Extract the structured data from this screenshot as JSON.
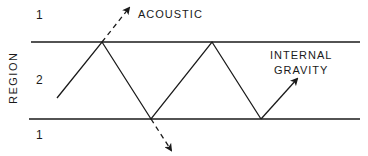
{
  "diagram": {
    "axis_title": "REGION",
    "regions": {
      "upper": "1",
      "middle": "2",
      "lower": "1"
    },
    "labels": {
      "acoustic": "ACOUSTIC",
      "internal_line1": "INTERNAL",
      "internal_line2": "GRAVITY"
    },
    "colors": {
      "ink": "#1a1a1a",
      "background": "#ffffff"
    }
  }
}
